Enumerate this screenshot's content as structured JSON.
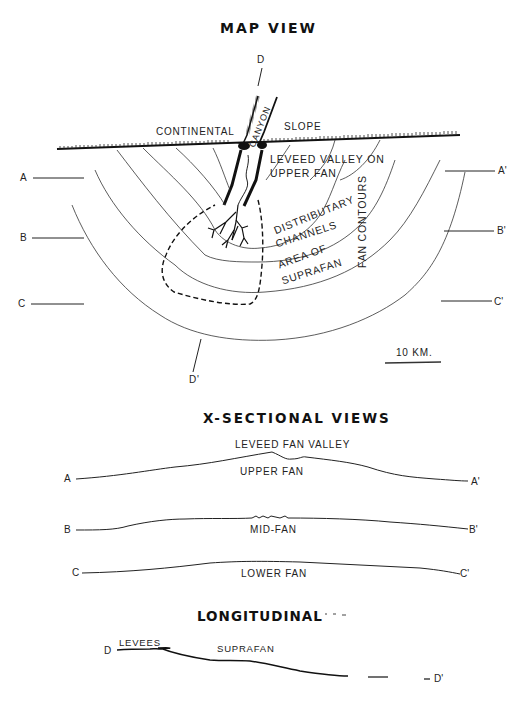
{
  "map_view": {
    "title": "MAP VIEW",
    "labels": {
      "d_top": "D",
      "d_bottom": "D'",
      "continental": "CONTINENTAL",
      "slope": "SLOPE",
      "canyon": "CANYON",
      "leveed_valley_1": "LEVEED VALLEY ON",
      "leveed_valley_2": "UPPER FAN",
      "distributary_1": "DISTRIBUTARY",
      "distributary_2": "CHANNELS",
      "suprafan_1": "AREA OF",
      "suprafan_2": "SUPRAFAN",
      "fan_contours": "FAN CONTOURS"
    },
    "section_lines": {
      "a": "A",
      "a_prime": "A'",
      "b": "B",
      "b_prime": "B'",
      "c": "C",
      "c_prime": "C'"
    },
    "scale_bar": "10 KM."
  },
  "cross_sections": {
    "title": "X-SECTIONAL VIEWS",
    "profiles": [
      {
        "start": "A",
        "end": "A'",
        "label": "UPPER FAN",
        "top_label": "LEVEED FAN VALLEY"
      },
      {
        "start": "B",
        "end": "B'",
        "label": "MID-FAN"
      },
      {
        "start": "C",
        "end": "C'",
        "label": "LOWER FAN"
      }
    ]
  },
  "longitudinal": {
    "title": "LONGITUDINAL",
    "start": "D",
    "end": "D'",
    "labels": {
      "levees": "LEVEES",
      "suprafan": "SUPRAFAN"
    }
  }
}
